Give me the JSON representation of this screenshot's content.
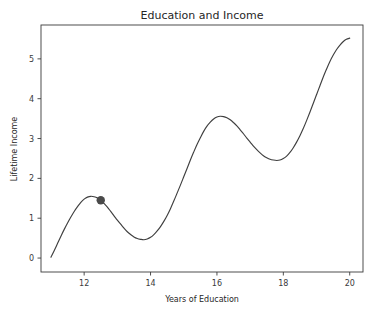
{
  "chart_data": {
    "type": "line",
    "title": "Education and Income",
    "xlabel": "Years of Education",
    "ylabel": "Lifetime Income",
    "xlim": [
      10.7,
      20.4
    ],
    "ylim": [
      -0.35,
      5.85
    ],
    "xticks": [
      12,
      14,
      16,
      18,
      20
    ],
    "xtick_labels": [
      "12",
      "14",
      "16",
      "18",
      "20"
    ],
    "yticks": [
      0,
      1,
      2,
      3,
      4,
      5
    ],
    "ytick_labels": [
      "0",
      "1",
      "2",
      "3",
      "4",
      "5"
    ],
    "grid": false,
    "legend": null,
    "line_color": "#3f3f3f",
    "marker_color": "#4a4a4a",
    "background_color": "#ffffff",
    "series": [
      {
        "name": "Lifetime Income",
        "x": [
          11.0,
          11.1,
          11.2,
          11.3,
          11.4,
          11.5,
          11.6,
          11.7,
          11.8,
          11.9,
          12.0,
          12.1,
          12.2,
          12.3,
          12.4,
          12.5,
          12.6,
          12.7,
          12.8,
          12.9,
          13.0,
          13.1,
          13.2,
          13.3,
          13.4,
          13.5,
          13.6,
          13.7,
          13.8,
          13.9,
          14.0,
          14.1,
          14.2,
          14.3,
          14.4,
          14.5,
          14.6,
          14.7,
          14.8,
          14.9,
          15.0,
          15.1,
          15.2,
          15.3,
          15.4,
          15.5,
          15.6,
          15.7,
          15.8,
          15.9,
          16.0,
          16.1,
          16.2,
          16.3,
          16.4,
          16.5,
          16.6,
          16.7,
          16.8,
          16.9,
          17.0,
          17.1,
          17.2,
          17.3,
          17.4,
          17.5,
          17.6,
          17.7,
          17.8,
          17.9,
          18.0,
          18.1,
          18.2,
          18.3,
          18.4,
          18.5,
          18.6,
          18.7,
          18.8,
          18.9,
          19.0,
          19.1,
          19.2,
          19.3,
          19.4,
          19.5,
          19.6,
          19.7,
          19.8,
          19.9,
          20.0
        ],
        "y": [
          0.02,
          0.19,
          0.37,
          0.55,
          0.72,
          0.88,
          1.03,
          1.17,
          1.29,
          1.4,
          1.48,
          1.53,
          1.55,
          1.54,
          1.51,
          1.45,
          1.37,
          1.28,
          1.17,
          1.06,
          0.95,
          0.85,
          0.75,
          0.66,
          0.59,
          0.53,
          0.49,
          0.47,
          0.46,
          0.48,
          0.52,
          0.59,
          0.68,
          0.79,
          0.92,
          1.07,
          1.24,
          1.43,
          1.63,
          1.83,
          2.04,
          2.25,
          2.46,
          2.66,
          2.85,
          3.02,
          3.18,
          3.31,
          3.41,
          3.49,
          3.54,
          3.56,
          3.55,
          3.52,
          3.47,
          3.4,
          3.32,
          3.22,
          3.12,
          3.01,
          2.91,
          2.81,
          2.72,
          2.64,
          2.57,
          2.52,
          2.48,
          2.46,
          2.45,
          2.46,
          2.5,
          2.56,
          2.65,
          2.77,
          2.91,
          3.07,
          3.25,
          3.45,
          3.66,
          3.88,
          4.1,
          4.32,
          4.54,
          4.74,
          4.93,
          5.09,
          5.23,
          5.34,
          5.43,
          5.49,
          5.52
        ]
      }
    ],
    "markers": [
      {
        "label": "highlighted-point",
        "x": 12.5,
        "y": 1.45,
        "color": "#4a4a4a",
        "size": 4.2
      }
    ]
  }
}
